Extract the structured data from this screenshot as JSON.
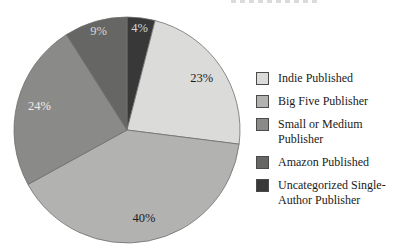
{
  "chart_data": {
    "type": "pie",
    "unit": "%",
    "slice_order": "clockwise-from-12-oclock",
    "slices": [
      {
        "label": "Uncategorized Single-Author Publisher",
        "value": 4,
        "color": "#383838",
        "label_color": "#d6d6d6"
      },
      {
        "label": "Indie Published",
        "value": 23,
        "color": "#dbdbd9",
        "label_color": "#1c1c1c"
      },
      {
        "label": "Big Five Publisher",
        "value": 40,
        "color": "#b2b2b0",
        "label_color": "#1c1c1c"
      },
      {
        "label": "Small or Medium Publisher",
        "value": 24,
        "color": "#8a8a88",
        "label_color": "#ececea"
      },
      {
        "label": "Amazon Published",
        "value": 9,
        "color": "#666664",
        "label_color": "#d6d6d6"
      }
    ],
    "stroke_color": "#6f6f6f",
    "legend": {
      "position": "right",
      "display_order_slice_indices": [
        1,
        2,
        3,
        4,
        0
      ]
    }
  }
}
